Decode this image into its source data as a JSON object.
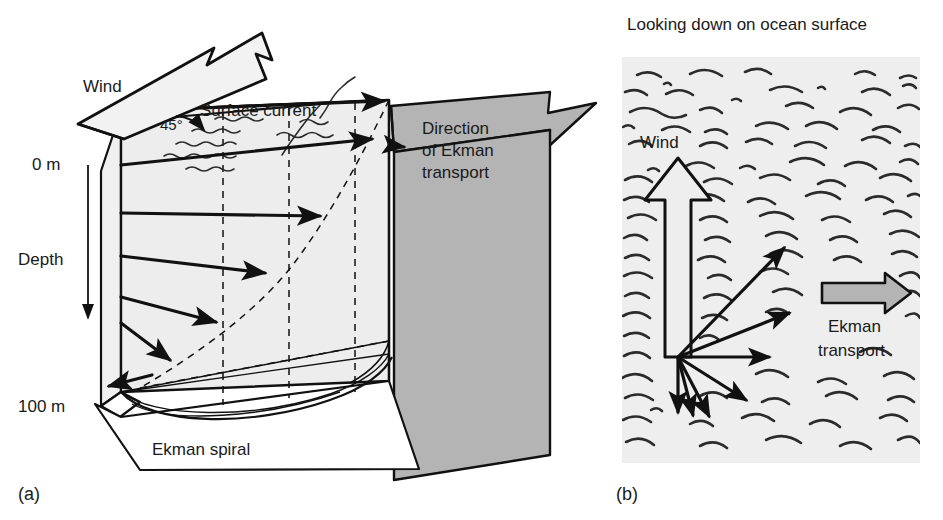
{
  "figure": {
    "width": 943,
    "height": 520,
    "background": "#ffffff"
  },
  "colors": {
    "ink": "#111111",
    "text": "#1a1a1a",
    "block_face_light": "#f0f0f0",
    "block_face_mid": "#e6e6e6",
    "arrow_gray": "#b4b4b4",
    "panel_b_bg": "#eeeeee",
    "wave_stroke": "#2b2b2b",
    "white": "#ffffff"
  },
  "panel_a": {
    "key": "(a)",
    "caption": "(a)",
    "labels": {
      "wind": "Wind",
      "surface_current": "Surface current",
      "angle": "45°",
      "depth_top": "0 m",
      "depth_axis": "Depth",
      "depth_bottom": "100 m",
      "ekman_spiral": "Ekman spiral",
      "direction_line1": "Direction",
      "direction_line2": "of  Ekman",
      "direction_line3": "transport"
    },
    "depth_scale": {
      "top_value": "0 m",
      "bottom_value": "100 m",
      "axis_title": "Depth",
      "direction": "downward"
    },
    "surface_wind_angle_deg": 45,
    "spiral_arrows": [
      {
        "index": 0,
        "depth_label": "0 m",
        "note": "surface current, 45° right of wind"
      },
      {
        "index": 1,
        "depth_label": "",
        "note": "current veers further right with depth"
      },
      {
        "index": 2,
        "depth_label": "",
        "note": "current veers further right with depth"
      },
      {
        "index": 3,
        "depth_label": "",
        "note": "current veers further right with depth"
      },
      {
        "index": 4,
        "depth_label": "",
        "note": "current veers further right with depth"
      },
      {
        "index": 5,
        "depth_label": "100 m",
        "note": "deepest current, opposite to surface current"
      }
    ]
  },
  "panel_b": {
    "key": "(b)",
    "caption": "(b)",
    "title": "Looking down on ocean surface",
    "labels": {
      "wind": "Wind",
      "ekman_transport_line1": "Ekman",
      "ekman_transport_line2": "transport"
    },
    "wind_direction": "up",
    "ekman_transport_direction": "right",
    "current_vectors": [
      {
        "index": 0,
        "angle_deg": 45,
        "length": 150,
        "note": "surface current 45° right of wind"
      },
      {
        "index": 1,
        "angle_deg": 20,
        "length": 118,
        "note": "shallow"
      },
      {
        "index": 2,
        "angle_deg": 0,
        "length": 92,
        "note": "mid"
      },
      {
        "index": 3,
        "angle_deg": -32,
        "length": 78,
        "note": "deeper"
      },
      {
        "index": 4,
        "angle_deg": -62,
        "length": 62,
        "note": "deeper"
      },
      {
        "index": 5,
        "angle_deg": -74,
        "length": 55,
        "note": "deeper"
      },
      {
        "index": 6,
        "angle_deg": -90,
        "length": 65,
        "note": "deepest, opposite surface"
      }
    ]
  },
  "icons": {
    "wind_block_arrow": "block-arrow-icon",
    "ekman_block_arrow": "block-arrow-icon",
    "depth_axis_arrow": "down-arrow-icon"
  }
}
